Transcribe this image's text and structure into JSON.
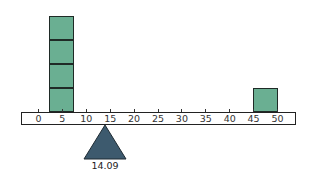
{
  "diagram": {
    "type": "balance-beam",
    "axis": {
      "min": 0,
      "max": 50,
      "step": 5,
      "ticks": [
        "0",
        "5",
        "10",
        "15",
        "20",
        "25",
        "30",
        "35",
        "40",
        "45",
        "50"
      ]
    },
    "stacks": [
      {
        "position": 5,
        "count": 4
      },
      {
        "position": 47.5,
        "count": 1
      }
    ],
    "fulcrum": {
      "position": 14.09,
      "label": "14.09"
    },
    "colors": {
      "block": "#6aaf92",
      "fulcrum": "#3d5a6e",
      "outline": "#1f2a26"
    }
  }
}
